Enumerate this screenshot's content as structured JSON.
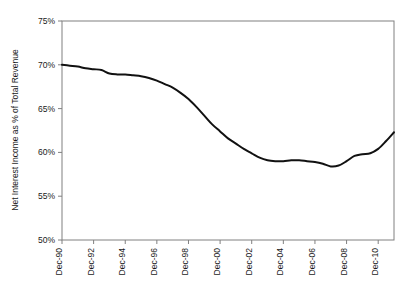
{
  "chart_data": {
    "type": "line",
    "title": "",
    "subtitle": "",
    "xlabel": "",
    "ylabel": "Net Interest Income as % of Total Revenue",
    "ylim": [
      50,
      75
    ],
    "yticks": [
      50,
      55,
      60,
      65,
      70,
      75
    ],
    "ytick_labels": [
      "50%",
      "55%",
      "60%",
      "65%",
      "70%",
      "75%"
    ],
    "xlim": [
      "Dec-90",
      "Dec-11"
    ],
    "xticks": [
      "Dec-90",
      "Dec-92",
      "Dec-94",
      "Dec-96",
      "Dec-98",
      "Dec-00",
      "Dec-02",
      "Dec-04",
      "Dec-06",
      "Dec-08",
      "Dec-10"
    ],
    "xtick_labels": [
      "Dec-90",
      "Dec-92",
      "Dec-94",
      "Dec-96",
      "Dec-98",
      "Dec-00",
      "Dec-02",
      "Dec-04",
      "Dec-06",
      "Dec-08",
      "Dec-10"
    ],
    "grid": false,
    "legend": null,
    "legend_position": "none",
    "line_color": "#111111",
    "axis_color": "#808080",
    "series": [
      {
        "name": "Net Interest Income as % of Total Revenue",
        "x": [
          "Dec-90",
          "Jun-91",
          "Dec-91",
          "Jun-92",
          "Dec-92",
          "Jun-93",
          "Dec-93",
          "Jun-94",
          "Dec-94",
          "Jun-95",
          "Dec-95",
          "Jun-96",
          "Dec-96",
          "Jun-97",
          "Dec-97",
          "Jun-98",
          "Dec-98",
          "Jun-99",
          "Dec-99",
          "Jun-00",
          "Dec-00",
          "Jun-01",
          "Dec-01",
          "Jun-02",
          "Dec-02",
          "Jun-03",
          "Dec-03",
          "Jun-04",
          "Dec-04",
          "Jun-05",
          "Dec-05",
          "Jun-06",
          "Dec-06",
          "Jun-07",
          "Dec-07",
          "Jun-08",
          "Dec-08",
          "Jun-09",
          "Dec-09",
          "Jun-10",
          "Dec-10",
          "Jun-11",
          "Dec-11"
        ],
        "values": [
          70.0,
          69.9,
          69.8,
          69.6,
          69.5,
          69.4,
          69.0,
          68.9,
          68.9,
          68.8,
          68.7,
          68.5,
          68.2,
          67.8,
          67.4,
          66.8,
          66.1,
          65.2,
          64.2,
          63.2,
          62.4,
          61.6,
          61.0,
          60.4,
          59.9,
          59.4,
          59.1,
          59.0,
          59.0,
          59.1,
          59.1,
          59.0,
          58.9,
          58.7,
          58.4,
          58.5,
          59.0,
          59.6,
          59.8,
          59.9,
          60.4,
          61.3,
          62.3
        ]
      }
    ],
    "annotations": []
  }
}
